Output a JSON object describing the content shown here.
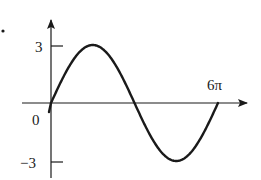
{
  "chart_data": {
    "type": "line",
    "title": "",
    "xlabel": "",
    "ylabel": "",
    "function": "y = 3 sin(x/3)",
    "x": [
      0,
      1.5708,
      3.1416,
      4.7124,
      6.2832,
      7.854,
      9.4248,
      10.9956,
      12.5664,
      14.1372,
      15.708,
      17.2788,
      18.8496
    ],
    "series": [
      {
        "name": "curve",
        "values": [
          0,
          1.5,
          2.598,
          3.0,
          2.598,
          1.5,
          0,
          -1.5,
          -2.598,
          -3.0,
          -2.598,
          -1.5,
          0
        ]
      }
    ],
    "xlim": [
      0,
      18.8496
    ],
    "ylim": [
      -3,
      3
    ],
    "x_tick_labels": [
      "0",
      "6π"
    ],
    "y_tick_labels": [
      "3",
      "−3"
    ],
    "grid": false,
    "legend": "none"
  },
  "labels": {
    "y_max": "3",
    "y_min": "−3",
    "origin": "0",
    "x_end": "6π"
  },
  "colors": {
    "ink": "#1a1a1a",
    "background": "#ffffff"
  }
}
